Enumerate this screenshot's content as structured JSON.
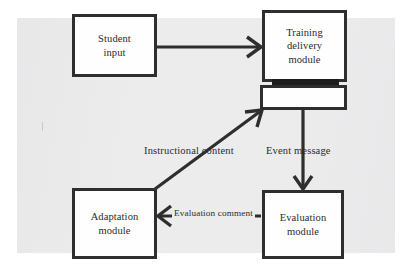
{
  "diagram": {
    "background_color": "#ececed",
    "line_color": "#2e2e2e",
    "node_fill": "#fefefe",
    "nodes": [
      {
        "id": "student-input",
        "label": "Student\ninput"
      },
      {
        "id": "training-delivery",
        "label": "Training\ndelivery\nmodule"
      },
      {
        "id": "buffer",
        "label": ""
      },
      {
        "id": "adaptation",
        "label": "Adaptation\nmodule"
      },
      {
        "id": "evaluation",
        "label": "Evaluation\nmodule"
      }
    ],
    "edges": [
      {
        "id": "student-to-training",
        "label": "",
        "from": "student-input",
        "to": "training-delivery",
        "arrow": "open-v"
      },
      {
        "id": "training-to-evaluation",
        "label": "Event message",
        "from": "buffer",
        "to": "evaluation",
        "arrow": "open-v"
      },
      {
        "id": "evaluation-to-adaptation",
        "label": "Evaluation comment",
        "from": "evaluation",
        "to": "adaptation",
        "arrow": "open-v"
      },
      {
        "id": "adaptation-to-training",
        "label": "Instructional content",
        "from": "adaptation",
        "to": "buffer",
        "arrow": "open-v"
      }
    ]
  }
}
